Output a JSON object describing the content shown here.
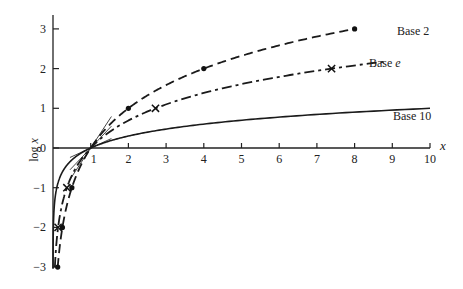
{
  "chart_data": {
    "type": "line",
    "title": "",
    "xlabel": "x",
    "ylabel": "log x",
    "xlim": [
      0,
      10
    ],
    "ylim": [
      -3,
      3
    ],
    "x_ticks": [
      1,
      2,
      3,
      4,
      5,
      6,
      7,
      8,
      9,
      10
    ],
    "y_ticks": [
      -3,
      -2,
      -1,
      0,
      1,
      2,
      3
    ],
    "y_tick_labels": [
      "−3",
      "−2",
      "−1",
      "0",
      "1",
      "2",
      "3"
    ],
    "grid": false,
    "legend": "inline labels at curve ends",
    "series": [
      {
        "name": "Base 2",
        "label": "Base 2",
        "base": 2,
        "style": "dashed",
        "marker": "dot",
        "marker_points": [
          [
            0.125,
            -3
          ],
          [
            0.25,
            -2
          ],
          [
            0.5,
            -1
          ],
          [
            2,
            1
          ],
          [
            4,
            2
          ],
          [
            8,
            3
          ]
        ],
        "x_range": [
          0.125,
          8
        ]
      },
      {
        "name": "Base e",
        "label": "Base e",
        "base": 2.718281828,
        "style": "dash-dot",
        "marker": "x",
        "marker_points": [
          [
            0.1353,
            -2
          ],
          [
            0.3679,
            -1
          ],
          [
            2.7183,
            1
          ],
          [
            7.389,
            2
          ]
        ],
        "x_range": [
          0.05,
          8.8
        ]
      },
      {
        "name": "Base 10",
        "label": "Base 10",
        "base": 10,
        "style": "solid",
        "marker": "none",
        "marker_points": [],
        "x_range": [
          0.001,
          10
        ]
      }
    ],
    "annotations": [
      "short tangent lines at (1, 0) for each base"
    ]
  },
  "labels": {
    "x_axis": "x",
    "y_axis_log": "log",
    "y_axis_var": "x",
    "base2": "Base 2",
    "basee_prefix": "Base ",
    "basee_var": "e",
    "base10": "Base 10"
  }
}
